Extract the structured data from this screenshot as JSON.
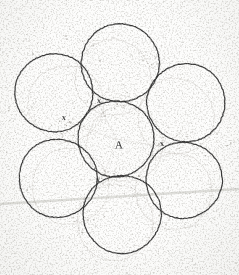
{
  "figure": {
    "medium": "scanned pencil drawing on white paper",
    "canvas": {
      "width": 239,
      "height": 275
    },
    "ink_color": "#2b2b2b",
    "ghost_color": "#b9b4ae",
    "paper_color": "#fdfdfc",
    "speckle_color": "#8c8880",
    "artifact_line_color": "#dcdcd8"
  },
  "labels": {
    "center_label": "A",
    "gap_marks": [
      "x",
      "x",
      "x",
      "x"
    ]
  },
  "annotations": [
    {
      "id": "center-label-a",
      "text": "A",
      "x": 119,
      "y": 145,
      "kind": "point-label"
    },
    {
      "id": "gap-mark-top",
      "text": "x",
      "x": 99,
      "y": 101,
      "kind": "gap-mark"
    },
    {
      "id": "gap-mark-right",
      "text": "x",
      "x": 162,
      "y": 144,
      "kind": "gap-mark"
    },
    {
      "id": "gap-mark-bottom-left",
      "text": "x",
      "x": 98,
      "y": 180,
      "kind": "gap-mark"
    },
    {
      "id": "gap-mark-upper-left",
      "text": "x",
      "x": 64,
      "y": 118,
      "kind": "gap-mark"
    }
  ],
  "chart_data": {
    "type": "scatter",
    "xlabel": "",
    "ylabel": "",
    "xlim": [
      0,
      239
    ],
    "ylim": [
      0,
      275
    ],
    "grid": false,
    "legend": "none",
    "circles": [
      {
        "name": "center",
        "cx": 116,
        "cy": 139,
        "r": 38,
        "style": "ink"
      },
      {
        "name": "top",
        "cx": 120,
        "cy": 63,
        "r": 39,
        "style": "ink"
      },
      {
        "name": "upper-left",
        "cx": 54,
        "cy": 93,
        "r": 39,
        "style": "ink"
      },
      {
        "name": "upper-right",
        "cx": 186,
        "cy": 103,
        "r": 39,
        "style": "ink"
      },
      {
        "name": "lower-left",
        "cx": 58,
        "cy": 178,
        "r": 39,
        "style": "ink"
      },
      {
        "name": "lower-right",
        "cx": 184,
        "cy": 180,
        "r": 38,
        "style": "ink"
      },
      {
        "name": "bottom",
        "cx": 122,
        "cy": 214,
        "r": 39,
        "style": "ink"
      },
      {
        "name": "ghost-center",
        "cx": 125,
        "cy": 144,
        "r": 38,
        "style": "ghost"
      },
      {
        "name": "ghost-top",
        "cx": 113,
        "cy": 78,
        "r": 38,
        "style": "ghost"
      },
      {
        "name": "ghost-upper-left",
        "cx": 66,
        "cy": 104,
        "r": 38,
        "style": "ghost"
      },
      {
        "name": "ghost-upper-right",
        "cx": 176,
        "cy": 117,
        "r": 38,
        "style": "ghost"
      },
      {
        "name": "ghost-lower-left",
        "cx": 70,
        "cy": 186,
        "r": 38,
        "style": "ghost"
      },
      {
        "name": "ghost-lower-right",
        "cx": 174,
        "cy": 191,
        "r": 38,
        "style": "ghost"
      },
      {
        "name": "ghost-bottom",
        "cx": 115,
        "cy": 222,
        "r": 38,
        "style": "ghost"
      }
    ],
    "radial_lines": [
      {
        "from": [
          116,
          139
        ],
        "to": [
          99,
          104
        ]
      },
      {
        "from": [
          116,
          139
        ],
        "to": [
          158,
          146
        ]
      },
      {
        "from": [
          116,
          139
        ],
        "to": [
          103,
          177
        ]
      },
      {
        "from": [
          116,
          139
        ],
        "to": [
          70,
          123
        ]
      }
    ],
    "artifact_lines": [
      {
        "from": [
          0,
          204
        ],
        "to": [
          239,
          189
        ],
        "color": "#dcdcd8",
        "width": 2.4
      }
    ]
  }
}
